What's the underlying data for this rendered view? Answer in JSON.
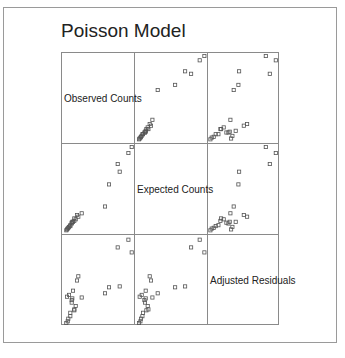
{
  "title": "Poisson Model",
  "variables": [
    "Observed Counts",
    "Expected Counts",
    "Adjusted Residuals"
  ],
  "chart_data": {
    "type": "scatter",
    "subtype": "scatterplot-matrix",
    "title": "Poisson Model",
    "variables": [
      "Observed Counts",
      "Expected Counts",
      "Adjusted Residuals"
    ],
    "layout": {
      "rows": 3,
      "cols": 3,
      "diagonal": "variable labels",
      "grid": false,
      "axes_ticks": false
    },
    "marker": "hollow square",
    "normalized_points_note": "Values normalized to [0,1] within each variable range (no tick labels shown).",
    "points": [
      {
        "observed": 1.0,
        "expected": 1.0,
        "residual": 0.83
      },
      {
        "observed": 0.82,
        "expected": 0.71,
        "residual": 0.43
      },
      {
        "observed": 0.79,
        "expected": 0.8,
        "residual": 0.89
      },
      {
        "observed": 0.66,
        "expected": 0.56,
        "residual": 0.42
      },
      {
        "observed": 0.95,
        "expected": 0.93,
        "residual": 0.98
      },
      {
        "observed": 0.6,
        "expected": 0.3,
        "residual": 0.35
      },
      {
        "observed": 0.25,
        "expected": 0.22,
        "residual": 0.3
      },
      {
        "observed": 0.2,
        "expected": 0.18,
        "residual": 0.55
      },
      {
        "observed": 0.18,
        "expected": 0.2,
        "residual": 0.5
      },
      {
        "observed": 0.16,
        "expected": 0.15,
        "residual": 0.2
      },
      {
        "observed": 0.14,
        "expected": 0.13,
        "residual": 0.15
      },
      {
        "observed": 0.12,
        "expected": 0.12,
        "residual": 0.38
      },
      {
        "observed": 0.1,
        "expected": 0.1,
        "residual": 0.27
      },
      {
        "observed": 0.1,
        "expected": 0.11,
        "residual": 0.24
      },
      {
        "observed": 0.08,
        "expected": 0.08,
        "residual": 0.12
      },
      {
        "observed": 0.08,
        "expected": 0.07,
        "residual": 0.08
      },
      {
        "observed": 0.06,
        "expected": 0.06,
        "residual": 0.33
      },
      {
        "observed": 0.05,
        "expected": 0.05,
        "residual": 0.05
      },
      {
        "observed": 0.04,
        "expected": 0.04,
        "residual": 0.02
      },
      {
        "observed": 0.03,
        "expected": 0.03,
        "residual": 0.31
      },
      {
        "observed": 0.02,
        "expected": 0.02,
        "residual": 0.0
      },
      {
        "observed": 0.11,
        "expected": 0.12,
        "residual": 0.29
      },
      {
        "observed": 0.14,
        "expected": 0.16,
        "residual": 0.16
      }
    ]
  }
}
